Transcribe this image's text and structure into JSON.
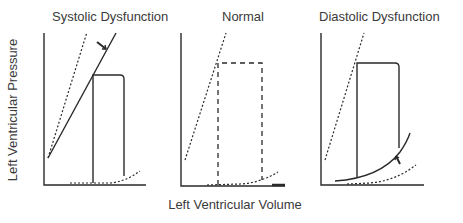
{
  "figure": {
    "panels": [
      {
        "title": "Systolic Dysfunction"
      },
      {
        "title": "Normal"
      },
      {
        "title": "Diastolic Dysfunction"
      }
    ],
    "ylabel": "Left Ventricular Pressure",
    "xlabel": "Left Ventricular Volume"
  },
  "colors": {
    "line": "#2a2a2a",
    "axis": "#3a3a3a"
  }
}
